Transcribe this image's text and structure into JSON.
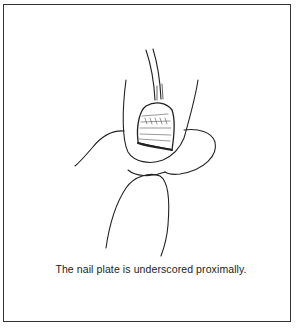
{
  "figure": {
    "caption": "The nail plate is underscored proximally.",
    "illustration": "fingertip-with-nail-plate-and-probe",
    "colors": {
      "line": "#222222",
      "background": "#ffffff",
      "border": "#333333"
    }
  }
}
